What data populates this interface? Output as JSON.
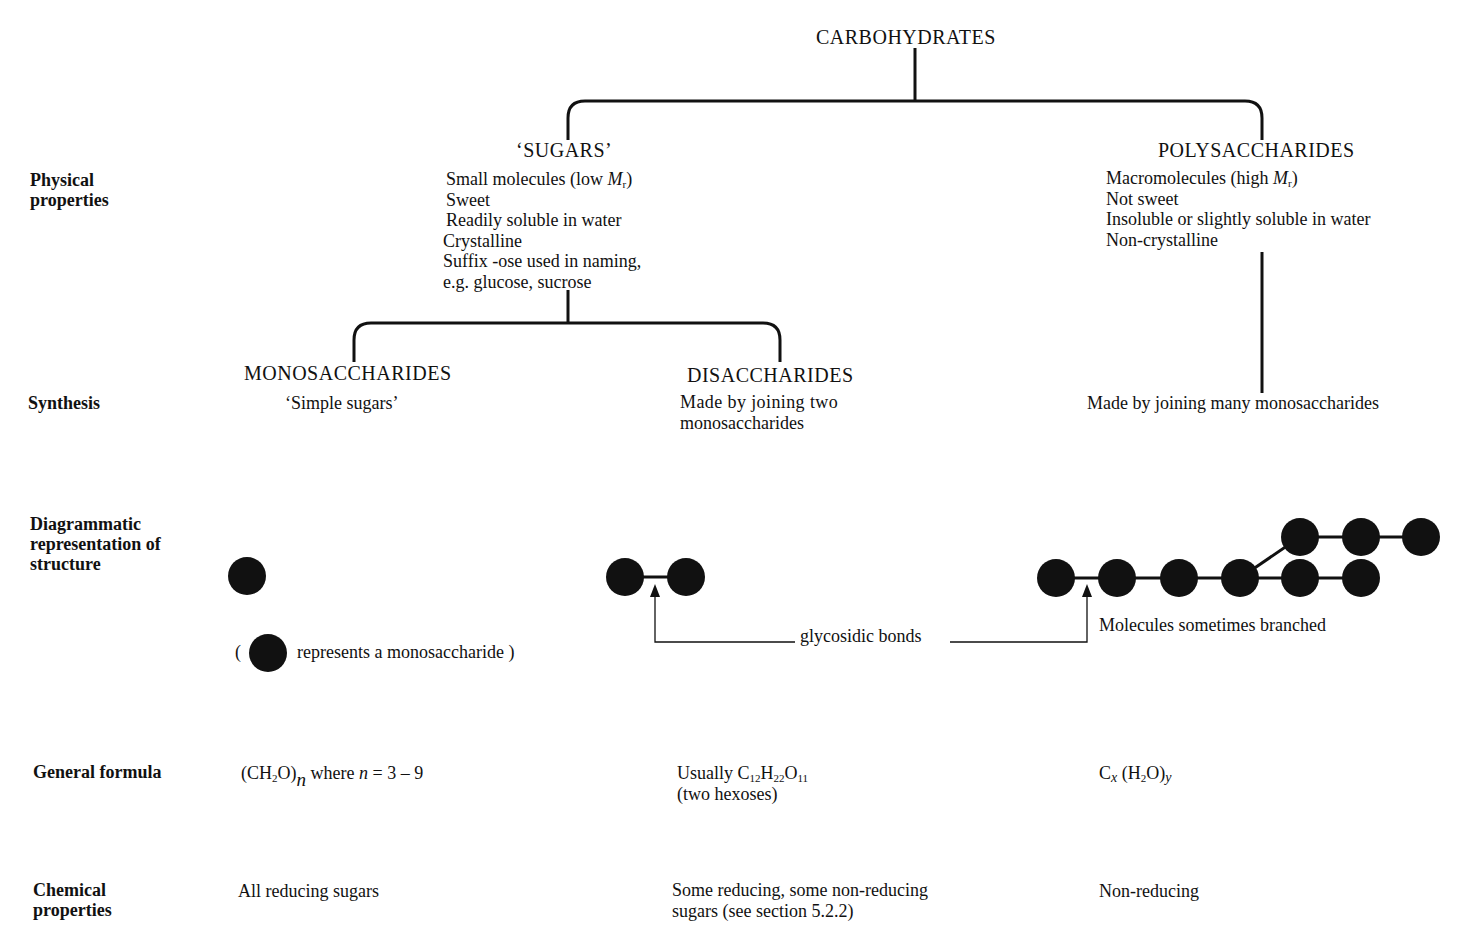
{
  "title": "CARBOHYDRATES",
  "row_labels": {
    "physical": "Physical properties",
    "synthesis": "Synthesis",
    "structure": "Diagrammatic representation of structure",
    "formula": "General formula",
    "chemical": "Chemical properties"
  },
  "sugars": {
    "heading": "‘SUGARS’",
    "physical": [
      "Small molecules (low Mr)",
      "Sweet",
      "Readily soluble in water",
      "Crystalline",
      "Suffix -ose used in naming,",
      "e.g. glucose, sucrose"
    ]
  },
  "polysaccharides": {
    "heading": "POLYSACCHARIDES",
    "physical": [
      "Macromolecules (high Mr)",
      "Not sweet",
      "Insoluble or slightly soluble in water",
      "Non-crystalline"
    ],
    "synthesis": "Made by joining many monosaccharides",
    "structure_note": "Molecules sometimes branched",
    "formula": "Cx (H2O)y",
    "chemical": "Non-reducing"
  },
  "monosaccharides": {
    "heading": "MONOSACCHARIDES",
    "synthesis": "‘Simple sugars’",
    "legend_open": "(",
    "legend_text": "represents a monosaccharide )",
    "formula": "(CH2O)n where n = 3 – 9",
    "chemical": "All reducing sugars"
  },
  "disaccharides": {
    "heading": "DISACCHARIDES",
    "synthesis": [
      "Made by joining two",
      "monosaccharides"
    ],
    "formula": [
      "Usually C12H22O11",
      "(two hexoses)"
    ],
    "chemical": [
      "Some reducing, some non-reducing",
      "sugars (see section 5.2.2)"
    ]
  },
  "bond_label": "glycosidic bonds",
  "colors": {
    "ink": "#111111",
    "background": "#ffffff"
  }
}
